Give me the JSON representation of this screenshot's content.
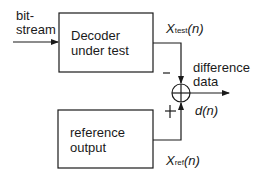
{
  "diagram": {
    "input_label_line1": "bit-",
    "input_label_line2": "stream",
    "decoder_box": {
      "line1": "Decoder",
      "line2": "under test"
    },
    "reference_box": {
      "line1": "reference",
      "line2": "output"
    },
    "x_test": {
      "var": "X",
      "sub": "test",
      "arg": "(n)"
    },
    "x_ref": {
      "var": "X",
      "sub": "ref",
      "arg": "(n)"
    },
    "minus_sign": "−",
    "plus_sign": "+",
    "output_label_line1": "difference",
    "output_label_line2": "data",
    "d_n": {
      "var": "d",
      "arg": "(n)"
    },
    "stroke_color": "#1a1a1a"
  }
}
